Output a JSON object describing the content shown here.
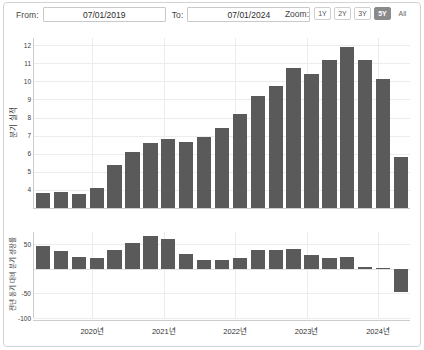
{
  "toolbar": {
    "from_label": "From:",
    "from_value": "07/01/2019",
    "to_label": "To:",
    "to_value": "07/01/2024",
    "date_placeholder": "mm/dd/yyyy",
    "zoom_label": "Zoom:",
    "zoom_options": [
      {
        "id": "1y",
        "label": "1Y",
        "selected": false
      },
      {
        "id": "2y",
        "label": "2Y",
        "selected": false
      },
      {
        "id": "3y",
        "label": "3Y",
        "selected": false
      },
      {
        "id": "5y",
        "label": "5Y",
        "selected": true
      },
      {
        "id": "all",
        "label": "All",
        "selected": false
      }
    ]
  },
  "colors": {
    "bar": "#5a5a5a",
    "grid": "#ececec",
    "axis": "#cdcdcd",
    "selected_button": "#8a8a8a",
    "panel_border": "#d3d3d3"
  },
  "chart_data": [
    {
      "id": "quarterly-revenue",
      "type": "bar",
      "title": "",
      "ylabel": "분기 실적",
      "xlabel": "",
      "ylim": [
        3,
        12.4
      ],
      "yticks": [
        4,
        5,
        6,
        7,
        8,
        9,
        10,
        11,
        12
      ],
      "grid": true,
      "categories": [
        "2019 Q3",
        "2019 Q4",
        "2020 Q1",
        "2020 Q2",
        "2020 Q3",
        "2020 Q4",
        "2021 Q1",
        "2021 Q2",
        "2021 Q3",
        "2021 Q4",
        "2022 Q1",
        "2022 Q2",
        "2022 Q3",
        "2022 Q4",
        "2023 Q1",
        "2023 Q2",
        "2023 Q3",
        "2023 Q4",
        "2024 Q1",
        "2024 Q2",
        "2024 Q3"
      ],
      "values": [
        3.85,
        3.9,
        3.75,
        4.1,
        5.4,
        6.1,
        6.6,
        6.8,
        6.65,
        6.9,
        7.45,
        8.2,
        9.2,
        9.75,
        10.75,
        10.4,
        11.2,
        11.9,
        11.2,
        10.15,
        5.8
      ]
    },
    {
      "id": "yoy-quarterly-growth",
      "type": "bar",
      "title": "",
      "ylabel": "전년 동기 대비 분기 성장률",
      "xlabel": "",
      "ylim": [
        -100,
        75
      ],
      "yticks": [
        50,
        -50,
        -100
      ],
      "grid": true,
      "categories": [
        "2019 Q3",
        "2019 Q4",
        "2020 Q1",
        "2020 Q2",
        "2020 Q3",
        "2020 Q4",
        "2021 Q1",
        "2021 Q2",
        "2021 Q3",
        "2021 Q4",
        "2022 Q1",
        "2022 Q2",
        "2022 Q3",
        "2022 Q4",
        "2023 Q1",
        "2023 Q2",
        "2023 Q3",
        "2023 Q4",
        "2024 Q1",
        "2024 Q2",
        "2024 Q3"
      ],
      "values": [
        46,
        36,
        24,
        23,
        38,
        52,
        66,
        60,
        30,
        19,
        19,
        23,
        38,
        39,
        41,
        29,
        23,
        24,
        3,
        1,
        -47
      ]
    }
  ],
  "xaxis": {
    "ticks": [
      {
        "label": "2020년",
        "position": 0.155
      },
      {
        "label": "2021년",
        "position": 0.345
      },
      {
        "label": "2022년",
        "position": 0.535
      },
      {
        "label": "2023년",
        "position": 0.725
      },
      {
        "label": "2024년",
        "position": 0.915
      }
    ]
  }
}
